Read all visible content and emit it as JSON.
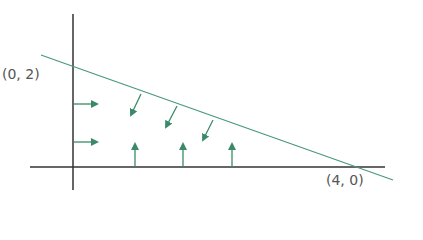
{
  "diagram": {
    "type": "vector-field-on-triangle-region",
    "labels": {
      "y_intercept": "(0, 2)",
      "x_intercept": "(4, 0)"
    },
    "colors": {
      "axes": "#333333",
      "line": "#4a9a7a",
      "arrows": "#3a8a6a",
      "labels": "#555555"
    },
    "boundary_line": {
      "from": [
        0,
        2
      ],
      "to": [
        4,
        0
      ]
    },
    "arrows": {
      "left_edge": {
        "direction": "right",
        "count": 2
      },
      "bottom_edge": {
        "direction": "up",
        "count": 3
      },
      "hypotenuse": {
        "direction": "down-left (inward)",
        "count": 3
      }
    }
  }
}
